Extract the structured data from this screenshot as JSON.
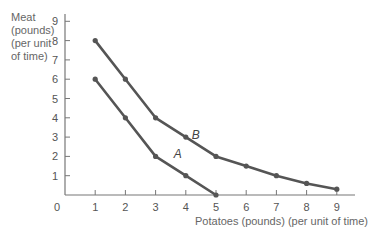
{
  "chart_data": {
    "type": "line",
    "title": "",
    "xlabel": "Potatoes (pounds) (per unit of time)",
    "ylabel_lines": [
      "Meat",
      "(pounds)",
      "(per unit",
      "of time)"
    ],
    "x_ticks": [
      1,
      2,
      3,
      4,
      5,
      6,
      7,
      8,
      9
    ],
    "y_ticks": [
      1,
      2,
      3,
      4,
      5,
      6,
      7,
      8,
      9
    ],
    "origin_label": "0",
    "xlim": [
      0,
      10
    ],
    "ylim": [
      0,
      9.5
    ],
    "grid": false,
    "series": [
      {
        "name": "A",
        "x": [
          1,
          2,
          3,
          4,
          5
        ],
        "values": [
          6,
          4,
          2,
          1,
          0
        ]
      },
      {
        "name": "B",
        "x": [
          1,
          2,
          3,
          4,
          5,
          6,
          7,
          8,
          9
        ],
        "values": [
          8,
          6,
          4,
          3,
          2,
          1.5,
          1,
          0.6,
          0.3
        ]
      }
    ],
    "annotations": [
      {
        "text": "A",
        "x": 3.6,
        "y": 1.9
      },
      {
        "text": "B",
        "x": 4.2,
        "y": 2.9
      }
    ],
    "line_color": "#555555"
  }
}
